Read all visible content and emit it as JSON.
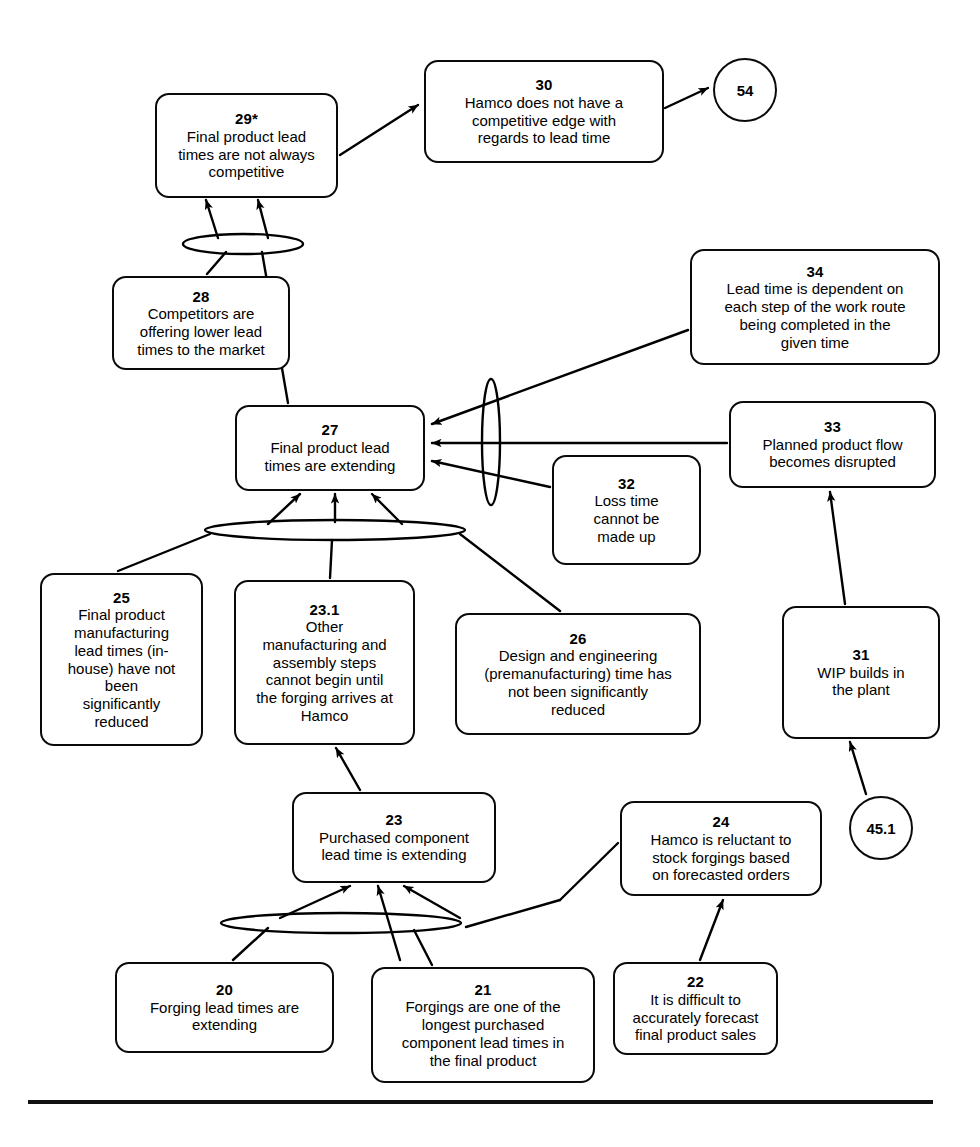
{
  "diagram": {
    "type": "current-reality-tree",
    "title": "",
    "line_color": "#000000",
    "background": "#ffffff",
    "nodes": [
      {
        "id": "n29",
        "num": "29*",
        "text": "Final product lead\ntimes are not always\ncompetitive",
        "shape": "rounded-rect",
        "x": 155,
        "y": 93,
        "w": 183,
        "h": 105
      },
      {
        "id": "n30",
        "num": "30",
        "text": "Hamco does not have a\ncompetitive edge with\nregards to lead time",
        "shape": "rounded-rect",
        "x": 424,
        "y": 60,
        "w": 240,
        "h": 103
      },
      {
        "id": "n54",
        "num": "54",
        "text": "",
        "shape": "circle",
        "x": 713,
        "y": 58,
        "w": 64,
        "h": 64
      },
      {
        "id": "n28",
        "num": "28",
        "text": "Competitors are\noffering lower lead\ntimes to the market",
        "shape": "rounded-rect",
        "x": 112,
        "y": 276,
        "w": 178,
        "h": 94
      },
      {
        "id": "n34",
        "num": "34",
        "text": "Lead time is dependent on\neach step of the work route\nbeing completed in the\ngiven time",
        "shape": "rounded-rect",
        "x": 690,
        "y": 249,
        "w": 250,
        "h": 116
      },
      {
        "id": "n27",
        "num": "27",
        "text": "Final product lead\ntimes are extending",
        "shape": "rounded-rect",
        "x": 235,
        "y": 405,
        "w": 190,
        "h": 86
      },
      {
        "id": "n33",
        "num": "33",
        "text": "Planned product flow\nbecomes disrupted",
        "shape": "rounded-rect",
        "x": 729,
        "y": 401,
        "w": 207,
        "h": 87
      },
      {
        "id": "n32",
        "num": "32",
        "text": "Loss time\ncannot be\nmade up",
        "shape": "rounded-rect",
        "x": 552,
        "y": 455,
        "w": 149,
        "h": 110
      },
      {
        "id": "n25",
        "num": "25",
        "text": "Final product\nmanufacturing\nlead times (in-\nhouse) have not\nbeen\nsignificantly\nreduced",
        "shape": "rounded-rect",
        "x": 40,
        "y": 573,
        "w": 163,
        "h": 173
      },
      {
        "id": "n23_1",
        "num": "23.1",
        "text": "Other\nmanufacturing and\nassembly steps\ncannot begin until\nthe forging arrives at\nHamco",
        "shape": "rounded-rect",
        "x": 234,
        "y": 580,
        "w": 181,
        "h": 165
      },
      {
        "id": "n26",
        "num": "26",
        "text": "Design and engineering\n(premanufacturing) time has\nnot been significantly\nreduced",
        "shape": "rounded-rect",
        "x": 455,
        "y": 613,
        "w": 246,
        "h": 122
      },
      {
        "id": "n31",
        "num": "31",
        "text": "WIP builds in\nthe plant",
        "shape": "rounded-rect",
        "x": 782,
        "y": 606,
        "w": 158,
        "h": 133
      },
      {
        "id": "n23",
        "num": "23",
        "text": "Purchased component\nlead time is extending",
        "shape": "rounded-rect",
        "x": 292,
        "y": 792,
        "w": 204,
        "h": 91
      },
      {
        "id": "n24",
        "num": "24",
        "text": "Hamco is reluctant to\nstock forgings based\non forecasted orders",
        "shape": "rounded-rect",
        "x": 620,
        "y": 801,
        "w": 202,
        "h": 95
      },
      {
        "id": "n45_1",
        "num": "45.1",
        "text": "",
        "shape": "circle",
        "x": 849,
        "y": 796,
        "w": 64,
        "h": 64
      },
      {
        "id": "n20",
        "num": "20",
        "text": "Forging lead times are\nextending",
        "shape": "rounded-rect",
        "x": 115,
        "y": 962,
        "w": 219,
        "h": 91
      },
      {
        "id": "n21",
        "num": "21",
        "text": "Forgings are one of the\nlongest purchased\ncomponent lead times in\nthe final product",
        "shape": "rounded-rect",
        "x": 371,
        "y": 967,
        "w": 224,
        "h": 116
      },
      {
        "id": "n22",
        "num": "22",
        "text": "It is difficult to\naccurately forecast\nfinal product sales",
        "shape": "rounded-rect",
        "x": 613,
        "y": 962,
        "w": 165,
        "h": 93
      }
    ],
    "connectors": [
      {
        "id": "and-29",
        "kind": "and-ellipse",
        "orientation": "horizontal",
        "cx": 243,
        "cy": 244,
        "rx": 60,
        "ry": 10
      },
      {
        "id": "and-27-right",
        "kind": "and-ellipse",
        "orientation": "vertical",
        "cx": 491,
        "cy": 442,
        "rx": 9,
        "ry": 63
      },
      {
        "id": "and-27-bottom",
        "kind": "and-ellipse",
        "orientation": "horizontal",
        "cx": 335,
        "cy": 530,
        "rx": 130,
        "ry": 10
      },
      {
        "id": "and-23",
        "kind": "and-ellipse",
        "orientation": "horizontal",
        "cx": 341,
        "cy": 923,
        "rx": 120,
        "ry": 10
      }
    ],
    "edges": [
      {
        "from": "n29",
        "to": "n30",
        "label": ""
      },
      {
        "from": "n30",
        "to": "n54",
        "label": ""
      },
      {
        "from": "and-29",
        "to": "n29",
        "label": ""
      },
      {
        "from": "n28",
        "to": "and-29",
        "label": ""
      },
      {
        "from": "n27",
        "to": "and-29",
        "label": ""
      },
      {
        "from": "n34",
        "to": "n27",
        "label": ""
      },
      {
        "from": "n32",
        "to": "n27",
        "label": ""
      },
      {
        "from": "n33",
        "to": "n34",
        "label": ""
      },
      {
        "from": "n31",
        "to": "n33",
        "label": ""
      },
      {
        "from": "n45_1",
        "to": "n31",
        "label": ""
      },
      {
        "from": "and-27-bottom",
        "to": "n27",
        "label": ""
      },
      {
        "from": "n25",
        "to": "and-27-bottom",
        "label": ""
      },
      {
        "from": "n23_1",
        "to": "and-27-bottom",
        "label": ""
      },
      {
        "from": "n26",
        "to": "and-27-bottom",
        "label": ""
      },
      {
        "from": "n23",
        "to": "n23_1",
        "label": ""
      },
      {
        "from": "and-23",
        "to": "n23",
        "label": ""
      },
      {
        "from": "n20",
        "to": "and-23",
        "label": ""
      },
      {
        "from": "n21",
        "to": "and-23",
        "label": ""
      },
      {
        "from": "n24",
        "to": "and-23",
        "label": ""
      },
      {
        "from": "n22",
        "to": "n24",
        "label": ""
      }
    ]
  }
}
